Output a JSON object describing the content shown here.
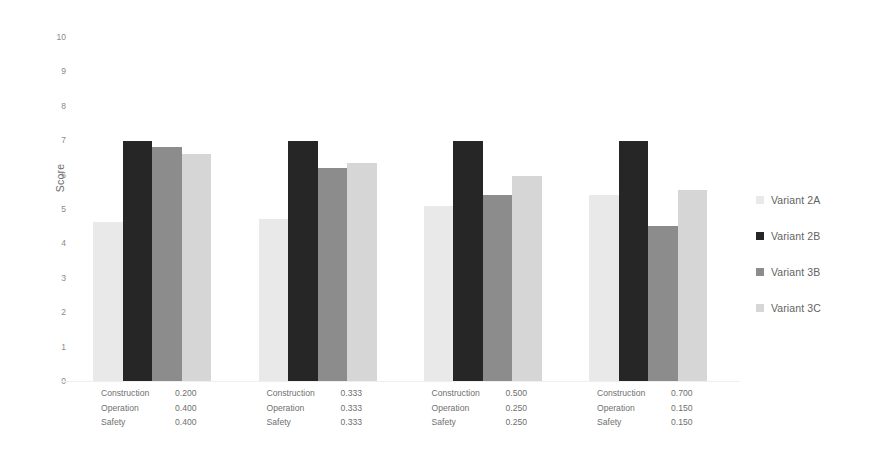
{
  "chart_data": {
    "type": "bar",
    "title": "",
    "subtitle": "",
    "xlabel": "",
    "ylabel": "Score",
    "ylim": [
      0,
      10
    ],
    "ytick_labels": [
      "0",
      "1",
      "2",
      "3",
      "4",
      "5",
      "6",
      "7",
      "8",
      "9",
      "10"
    ],
    "ytick_values": [
      0,
      1,
      2,
      3,
      4,
      5,
      6,
      7,
      8,
      9,
      10
    ],
    "grid": false,
    "legend_position": "right",
    "categories": [
      "Weighting 1",
      "Weighting 2",
      "Weighting 3",
      "Weighting 4"
    ],
    "category_details": [
      {
        "criteria": [
          "Construction",
          "Operation",
          "Safety"
        ],
        "weights": [
          "0.200",
          "0.400",
          "0.400"
        ]
      },
      {
        "criteria": [
          "Construction",
          "Operation",
          "Safety"
        ],
        "weights": [
          "0.333",
          "0.333",
          "0.333"
        ]
      },
      {
        "criteria": [
          "Construction",
          "Operation",
          "Safety"
        ],
        "weights": [
          "0.500",
          "0.250",
          "0.250"
        ]
      },
      {
        "criteria": [
          "Construction",
          "Operation",
          "Safety"
        ],
        "weights": [
          "0.700",
          "0.150",
          "0.150"
        ]
      }
    ],
    "series": [
      {
        "name": "Variant 2A",
        "color": "#e9e9e9",
        "values": [
          4.62,
          4.7,
          5.1,
          5.4
        ]
      },
      {
        "name": "Variant 2B",
        "color": "#262626",
        "values": [
          6.98,
          6.98,
          6.98,
          6.98
        ]
      },
      {
        "name": "Variant 3B",
        "color": "#8c8c8c",
        "values": [
          6.8,
          6.2,
          5.4,
          4.5
        ]
      },
      {
        "name": "Variant 3C",
        "color": "#d6d6d6",
        "values": [
          6.6,
          6.35,
          5.95,
          5.55
        ]
      }
    ]
  },
  "legend": {
    "items": [
      {
        "label": "Variant 2A",
        "color": "#e9e9e9"
      },
      {
        "label": "Variant 2B",
        "color": "#262626"
      },
      {
        "label": "Variant 3B",
        "color": "#8c8c8c"
      },
      {
        "label": "Variant 3C",
        "color": "#d6d6d6"
      }
    ]
  }
}
